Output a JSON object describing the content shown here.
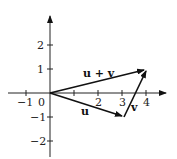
{
  "diagram": {
    "type": "vector-addition",
    "axes": {
      "x_ticks": [
        {
          "value": -1,
          "label": "−1"
        },
        {
          "value": 1,
          "label": ""
        },
        {
          "value": 2,
          "label": "2"
        },
        {
          "value": 3,
          "label": "3"
        },
        {
          "value": 4,
          "label": "4"
        }
      ],
      "y_ticks": [
        {
          "value": 2,
          "label": "2"
        },
        {
          "value": 1,
          "label": "1"
        },
        {
          "value": -1,
          "label": "−1"
        },
        {
          "value": -2,
          "label": "−2"
        }
      ],
      "origin_label": "0"
    },
    "vectors": [
      {
        "name": "u",
        "label": "u",
        "from": [
          0,
          0
        ],
        "to": [
          3,
          -1
        ]
      },
      {
        "name": "v",
        "label": "v",
        "from": [
          3,
          -1
        ],
        "to": [
          4,
          1
        ]
      },
      {
        "name": "u_plus_v",
        "label": "u + v",
        "from": [
          0,
          0
        ],
        "to": [
          4,
          1
        ]
      }
    ],
    "colors": {
      "stroke": "#111111",
      "axis": "#222222"
    }
  }
}
